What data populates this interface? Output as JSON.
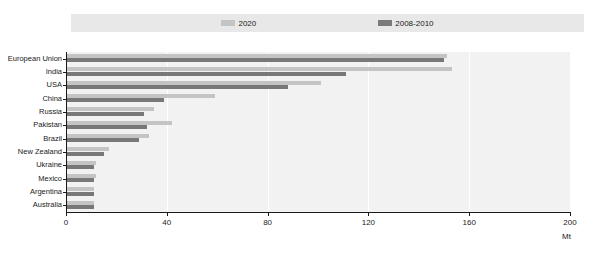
{
  "chart_data": {
    "type": "bar",
    "orientation": "horizontal",
    "title": "",
    "xlabel": "Mt",
    "ylabel": "",
    "xlim": [
      0,
      200
    ],
    "xticks": [
      0,
      40,
      80,
      120,
      160,
      200
    ],
    "grid": true,
    "legend_position": "top-center",
    "categories": [
      "European Union",
      "India",
      "USA",
      "China",
      "Russia",
      "Pakistan",
      "Brazil",
      "New Zealand",
      "Ukraine",
      "Mexico",
      "Argentina",
      "Australia"
    ],
    "series": [
      {
        "name": "2020",
        "color": "#c4c4c4",
        "values": [
          151,
          153,
          101,
          59,
          35,
          42,
          33,
          17,
          12,
          12,
          11,
          11
        ]
      },
      {
        "name": "2008-2010",
        "color": "#787878",
        "values": [
          150,
          111,
          88,
          39,
          31,
          32,
          29,
          15,
          11,
          11,
          11,
          11
        ]
      }
    ]
  },
  "legend": {
    "items": [
      {
        "label": "2020",
        "swatch_class": "sw-2020"
      },
      {
        "label": "2008-2010",
        "swatch_class": "sw-2008-2010"
      }
    ]
  },
  "axis": {
    "x_unit": "Mt",
    "tick_labels": [
      "0",
      "40",
      "80",
      "120",
      "160",
      "200"
    ]
  },
  "colors": {
    "series_2020": "#c4c4c4",
    "series_2008_2010": "#787878",
    "plot_background": "#f2f2f2",
    "legend_background": "#e8e8e8",
    "axis": "#1a1a1a"
  }
}
